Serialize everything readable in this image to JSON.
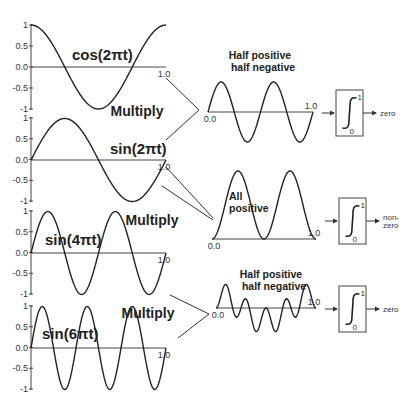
{
  "diagram": {
    "colors": {
      "ink": "#222222",
      "axis": "#444444",
      "background": "#ffffff"
    },
    "input_panels": [
      {
        "id": "cos2pt",
        "label": "cos(2πt)",
        "func": "cos",
        "freq": 1,
        "y_ticks": [
          "1",
          "0.5",
          "0.0",
          "-0.5",
          "-1"
        ],
        "x_end_label": "1.0",
        "y_top": 25,
        "y_zero": 67,
        "y_bottom": 109,
        "label_x": 72,
        "label_y": 60
      },
      {
        "id": "sin2pt",
        "label": "sin(2πt)",
        "func": "sin",
        "freq": 1,
        "y_ticks": [
          "1",
          "0.5",
          "0.0",
          "-0.5",
          "-1"
        ],
        "x_end_label": "1.0",
        "y_top": 118,
        "y_zero": 160,
        "y_bottom": 201,
        "label_x": 110,
        "label_y": 154
      },
      {
        "id": "sin4pt",
        "label": "sin(4πt)",
        "func": "sin",
        "freq": 2,
        "y_ticks": [
          "1",
          "0.5",
          "0.0",
          "-0.5",
          "-1"
        ],
        "x_end_label": "1.0",
        "y_top": 211,
        "y_zero": 253,
        "y_bottom": 294,
        "label_x": 45,
        "label_y": 245
      },
      {
        "id": "sin6pt",
        "label": "sin(6πt)",
        "func": "sin",
        "freq": 3,
        "y_ticks": [
          "1",
          "0.5",
          "0.0",
          "-0.5",
          "-1"
        ],
        "x_end_label": "1.0",
        "y_top": 306,
        "y_zero": 348,
        "y_bottom": 389,
        "label_x": 42,
        "label_y": 339
      }
    ],
    "multiply_labels": [
      {
        "text": "Multiply",
        "x": 137,
        "y": 116
      },
      {
        "text": "Multiply",
        "x": 152,
        "y": 225
      },
      {
        "text": "Multiply",
        "x": 148,
        "y": 318
      }
    ],
    "product_panels": [
      {
        "id": "cos2pt_x_sin2pt",
        "f1": "cos",
        "k1": 1,
        "f2": "sin",
        "k2": 1,
        "scale": 2,
        "x0": 208,
        "x1": 313,
        "y_zero": 112,
        "amp": 30,
        "start_label": "0.0",
        "end_label": "1.0",
        "note": [
          "Half positive",
          "half negative"
        ],
        "note_x": 260,
        "note_y": 59
      },
      {
        "id": "sin2pt_x_sin2pt",
        "f1": "sin",
        "k1": 1,
        "f2": "sin",
        "k2": 1,
        "scale": 1,
        "x0": 212,
        "x1": 316,
        "y_zero": 239,
        "amp": 68,
        "start_label": "0.0",
        "end_label": "1.0",
        "note": [
          "All",
          "positive"
        ],
        "note_x": 229,
        "note_y": 200
      },
      {
        "id": "sin4pt_x_sin6pt",
        "f1": "sin",
        "k1": 2,
        "f2": "sin",
        "k2": 3,
        "scale": 1,
        "x0": 216,
        "x1": 316,
        "y_zero": 308,
        "amp": 26,
        "start_label": "0.0",
        "end_label": "1.0",
        "note": [
          "Half positive",
          "half negative"
        ],
        "note_x": 271,
        "note_y": 278
      }
    ],
    "integrators": [
      {
        "x": 336,
        "y": 90,
        "w": 27,
        "h": 46,
        "upper": "1",
        "lower": "0",
        "result": [
          "zero"
        ]
      },
      {
        "x": 339,
        "y": 198,
        "w": 27,
        "h": 46,
        "upper": "1",
        "lower": "0",
        "result": [
          "non-",
          "zero"
        ]
      },
      {
        "x": 339,
        "y": 286,
        "w": 27,
        "h": 46,
        "upper": "1",
        "lower": "0",
        "result": [
          "zero"
        ]
      }
    ]
  }
}
